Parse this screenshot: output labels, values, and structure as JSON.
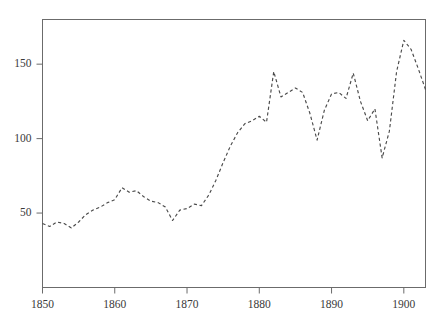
{
  "chart_data": {
    "type": "line",
    "title": "",
    "subtitle": "",
    "xlabel": "",
    "ylabel": "",
    "xlim": [
      1850,
      1903
    ],
    "ylim": [
      0,
      180
    ],
    "xticks": [
      1850,
      1860,
      1870,
      1880,
      1890,
      1900
    ],
    "xticklabels": [
      "1850",
      "1860",
      "1870",
      "1880",
      "1890",
      "1900"
    ],
    "yticks": [
      50,
      100,
      150
    ],
    "yticklabels": [
      "50",
      "100",
      "150"
    ],
    "grid": false,
    "legend": false,
    "legend_position": "none",
    "line_style": "dashed",
    "line_color": "#4a4a4a",
    "frame_color": "#6b6b6b",
    "background_color": "#ffffff",
    "x": [
      1850,
      1851,
      1852,
      1853,
      1854,
      1855,
      1856,
      1857,
      1858,
      1859,
      1860,
      1861,
      1862,
      1863,
      1864,
      1865,
      1866,
      1867,
      1868,
      1869,
      1870,
      1871,
      1872,
      1873,
      1874,
      1875,
      1876,
      1877,
      1878,
      1879,
      1880,
      1881,
      1882,
      1883,
      1884,
      1885,
      1886,
      1887,
      1888,
      1889,
      1890,
      1891,
      1892,
      1893,
      1894,
      1895,
      1896,
      1897,
      1898,
      1899,
      1900,
      1901,
      1902,
      1903
    ],
    "values": [
      43,
      41,
      44,
      43,
      40,
      44,
      49,
      52,
      54,
      57,
      59,
      67,
      64,
      65,
      61,
      58,
      57,
      54,
      45,
      52,
      53,
      56,
      55,
      62,
      72,
      84,
      95,
      104,
      110,
      112,
      115,
      111,
      145,
      128,
      131,
      134,
      131,
      117,
      99,
      119,
      130,
      131,
      127,
      144,
      125,
      112,
      120,
      87,
      105,
      145,
      166,
      160,
      147,
      133
    ],
    "series": [
      {
        "name": "series-1",
        "values": [
          43,
          41,
          44,
          43,
          40,
          44,
          49,
          52,
          54,
          57,
          59,
          67,
          64,
          65,
          61,
          58,
          57,
          54,
          45,
          52,
          53,
          56,
          55,
          62,
          72,
          84,
          95,
          104,
          110,
          112,
          115,
          111,
          145,
          128,
          131,
          134,
          131,
          117,
          99,
          119,
          130,
          131,
          127,
          144,
          125,
          112,
          120,
          87,
          105,
          145,
          166,
          160,
          147,
          133
        ]
      }
    ]
  }
}
